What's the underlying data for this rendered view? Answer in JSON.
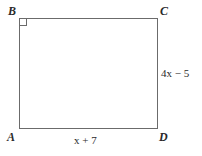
{
  "figure": {
    "type": "geometry-diagram",
    "shape": "rectangle",
    "background_color": "#ffffff",
    "line_color": "#6b6b6b",
    "text_color": "#2a2a2a",
    "vertices": {
      "top_left": "B",
      "top_right": "C",
      "bottom_left": "A",
      "bottom_right": "D"
    },
    "markers": {
      "right_angle_at": "B",
      "right_angle_icon": "right-angle-square-icon"
    },
    "side_labels": {
      "right_side": {
        "expression": "4x − 5",
        "coefficient": "4",
        "variable": "x",
        "operator": "−",
        "constant": "5",
        "between": "C-D"
      },
      "bottom_side": {
        "expression": "x + 7",
        "coefficient": "1",
        "variable": "x",
        "operator": "+",
        "constant": "7",
        "between": "A-D"
      }
    }
  }
}
